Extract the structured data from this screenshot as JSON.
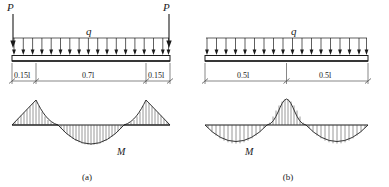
{
  "figure": {
    "panels": [
      {
        "caption": "(a)",
        "loads": {
          "point_left": "P",
          "point_right": "P",
          "distributed": "q"
        },
        "dimensions": [
          "0.15l",
          "0.7l",
          "0.15l"
        ],
        "moment_label": "M",
        "moment_description": "positive triangular peaks at the two interior supports, negative parabolic sag over the 0.7l mid span",
        "beam_span_fraction": [
          0.15,
          0.7,
          0.15
        ]
      },
      {
        "caption": "(b)",
        "loads": {
          "distributed": "q"
        },
        "dimensions": [
          "0.5l",
          "0.5l"
        ],
        "moment_label": "M",
        "moment_description": "negative parabolic sag in each half span, positive peak over the central support",
        "beam_span_fraction": [
          0.5,
          0.5
        ]
      }
    ],
    "colors": {
      "line": "#1a1a1a",
      "beam_fill": "#ffffff",
      "hatch": "#444444",
      "dim": "#555555"
    }
  }
}
